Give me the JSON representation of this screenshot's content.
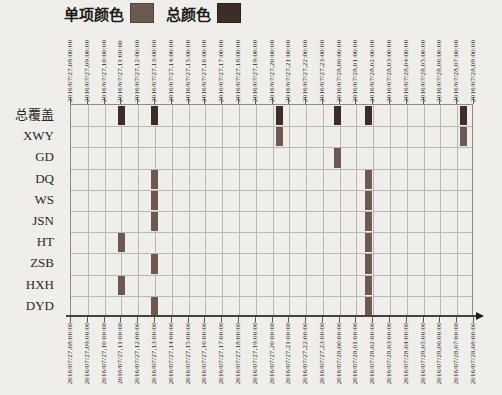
{
  "legend": {
    "item_color_label": "单项颜色",
    "item_color": "#6e5950",
    "total_color_label": "总颜色",
    "total_color": "#3c2d28"
  },
  "chart_data": {
    "type": "scatter",
    "subtype": "category-timeline-event-plot",
    "title": "",
    "legend_position": "top",
    "grid": true,
    "x_axis": {
      "start": "2016/07/27,08:00:00",
      "end": "2016/07/28,08:00:00",
      "tick_interval_hours": 1,
      "tick_labels": [
        "2016/07/27,08:00:00",
        "2016/07/27,09:00:00",
        "2016/07/27,10:00:00",
        "2016/07/27,11:00:00",
        "2016/07/27,12:00:00",
        "2016/07/27,13:00:00",
        "2016/07/27,14:00:00",
        "2016/07/27,15:00:00",
        "2016/07/27,16:00:00",
        "2016/07/27,17:00:00",
        "2016/07/27,18:00:00",
        "2016/07/27,19:00:00",
        "2016/07/27,20:00:00",
        "2016/07/27,21:00:00",
        "2016/07/27,22:00:00",
        "2016/07/27,23:00:00",
        "2016/07/28,00:00:00",
        "2016/07/28,01:00:00",
        "2016/07/28,02:00:00",
        "2016/07/28,03:00:00",
        "2016/07/28,04:00:00",
        "2016/07/28,05:00:00",
        "2016/07/28,06:00:00",
        "2016/07/28,07:00:00",
        "2016/07/28,08:00:00"
      ],
      "labels_shown_on": "top and bottom, rotated 90deg"
    },
    "categories": [
      "总覆盖",
      "XWY",
      "GD",
      "DQ",
      "WS",
      "JSN",
      "HT",
      "ZSB",
      "HXH",
      "DYD"
    ],
    "series": [
      {
        "name": "总覆盖",
        "color_role": "total",
        "events_hours_from_start": [
          3.0,
          5.0,
          12.4,
          15.9,
          17.7,
          23.4
        ],
        "events_time_approx": [
          "07/27 11:00",
          "07/27 13:00",
          "07/27 20:25",
          "07/27 23:55",
          "07/28 01:40",
          "07/28 07:25"
        ]
      },
      {
        "name": "XWY",
        "color_role": "item",
        "events_hours_from_start": [
          12.4,
          23.4
        ],
        "events_time_approx": [
          "07/27 20:25",
          "07/28 07:25"
        ]
      },
      {
        "name": "GD",
        "color_role": "item",
        "events_hours_from_start": [
          15.9
        ],
        "events_time_approx": [
          "07/27 23:55"
        ]
      },
      {
        "name": "DQ",
        "color_role": "item",
        "events_hours_from_start": [
          5.0,
          17.7
        ],
        "events_time_approx": [
          "07/27 13:00",
          "07/28 01:40"
        ]
      },
      {
        "name": "WS",
        "color_role": "item",
        "events_hours_from_start": [
          5.0,
          17.7
        ],
        "events_time_approx": [
          "07/27 13:00",
          "07/28 01:40"
        ]
      },
      {
        "name": "JSN",
        "color_role": "item",
        "events_hours_from_start": [
          5.0,
          17.7
        ],
        "events_time_approx": [
          "07/27 13:00",
          "07/28 01:40"
        ]
      },
      {
        "name": "HT",
        "color_role": "item",
        "events_hours_from_start": [
          3.0,
          17.7
        ],
        "events_time_approx": [
          "07/27 11:00",
          "07/28 01:40"
        ]
      },
      {
        "name": "ZSB",
        "color_role": "item",
        "events_hours_from_start": [
          5.0,
          17.7
        ],
        "events_time_approx": [
          "07/27 13:00",
          "07/28 01:40"
        ]
      },
      {
        "name": "HXH",
        "color_role": "item",
        "events_hours_from_start": [
          3.0,
          17.7
        ],
        "events_time_approx": [
          "07/27 11:00",
          "07/28 01:40"
        ]
      },
      {
        "name": "DYD",
        "color_role": "item",
        "events_hours_from_start": [
          5.0,
          17.7
        ],
        "events_time_approx": [
          "07/27 13:00",
          "07/28 01:40"
        ]
      }
    ]
  }
}
